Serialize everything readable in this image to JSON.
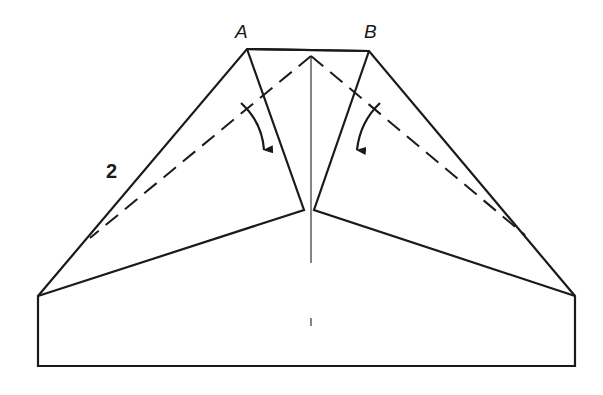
{
  "diagram": {
    "type": "paper-folding-instruction",
    "step_number": "2",
    "points": {
      "A": "A",
      "B": "B"
    },
    "colors": {
      "line": "#1a1a1a",
      "background": "#ffffff"
    },
    "instructions": [
      "Fold corner A down along dashed line toward center",
      "Fold corner B down along dashed line toward center"
    ]
  }
}
